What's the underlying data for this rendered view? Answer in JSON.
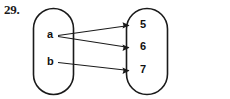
{
  "figure": {
    "problem_number": "29.",
    "type": "mapping-diagram",
    "stroke_color": "#1a1a1a",
    "background_color": "#ffffff",
    "domain": {
      "name": "domain-set",
      "elements": [
        {
          "label": "a",
          "x": 47,
          "y": 29
        },
        {
          "label": "b",
          "x": 47,
          "y": 56
        }
      ]
    },
    "codomain": {
      "name": "codomain-set",
      "elements": [
        {
          "label": "5",
          "x": 140,
          "y": 19
        },
        {
          "label": "6",
          "x": 140,
          "y": 41
        },
        {
          "label": "7",
          "x": 140,
          "y": 64
        }
      ]
    },
    "mappings": [
      {
        "from": "a",
        "to": "5"
      },
      {
        "from": "a",
        "to": "6"
      },
      {
        "from": "b",
        "to": "7"
      }
    ]
  }
}
